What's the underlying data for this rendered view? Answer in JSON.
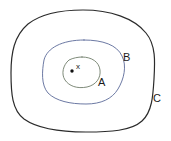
{
  "figure": {
    "background_color": "#ffffff",
    "width": 171,
    "height": 141
  },
  "labels": {
    "a": "A",
    "b": "B",
    "c": "C",
    "point": "x"
  },
  "colors": {
    "curve_a": "#6f7d6a",
    "curve_b": "#5b6a99",
    "curve_c": "#2b2b2b",
    "point": "#111111",
    "text": "#1b1b1b"
  },
  "diagram_data": {
    "type": "nested-regions",
    "point_label": "x",
    "point_position": {
      "x": 72,
      "y": 71
    },
    "curves": [
      {
        "name": "A",
        "role": "innermost-region",
        "color": "#6f7d6a",
        "stroke_width": 0.9,
        "label_position": {
          "x": 102,
          "y": 82
        },
        "bounds": {
          "left": 63,
          "top": 57,
          "right": 100,
          "bottom": 88
        }
      },
      {
        "name": "B",
        "role": "middle-region",
        "color": "#5b6a99",
        "stroke_width": 0.9,
        "label_position": {
          "x": 127,
          "y": 58
        },
        "bounds": {
          "left": 42,
          "top": 40,
          "right": 124,
          "bottom": 104
        }
      },
      {
        "name": "C",
        "role": "outermost-region",
        "color": "#2b2b2b",
        "stroke_width": 1.2,
        "label_position": {
          "x": 157,
          "y": 99
        },
        "bounds": {
          "left": 11,
          "top": 10,
          "right": 156,
          "bottom": 132
        }
      }
    ],
    "containment": "x is inside A; A is inside B; B is inside C"
  }
}
